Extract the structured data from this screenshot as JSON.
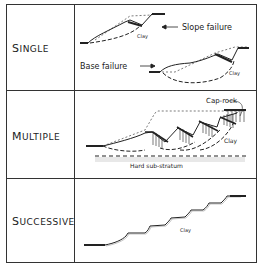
{
  "rows": [
    {
      "label": "Single",
      "label_first": "S",
      "label_rest": "INGLE"
    },
    {
      "label": "Multiple",
      "label_first": "M",
      "label_rest": "ULTIPLE"
    },
    {
      "label": "Successive",
      "label_first": "S",
      "label_rest": "UCCESSIVE"
    }
  ],
  "single": {
    "slope_failure_label": "Slope failure",
    "base_failure_label": "Base failure",
    "clay_label_1": "Clay",
    "clay_label_2": "Clay"
  },
  "multiple": {
    "cap_rock_label": "Cap-rock",
    "clay_label": "Clay",
    "substratum_label": "Hard sub-stratum"
  },
  "successive": {
    "clay_label": "Clay"
  }
}
